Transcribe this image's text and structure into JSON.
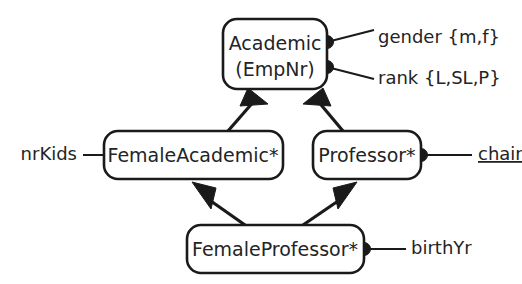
{
  "diagram": {
    "colors": {
      "stroke": "#1a1a1a",
      "text": "#242424",
      "background": "#ffffff"
    },
    "entities": [
      {
        "id": "academic",
        "line1": "Academic",
        "line2": "(EmpNr)"
      },
      {
        "id": "female_academic",
        "label": "FemaleAcademic*"
      },
      {
        "id": "professor",
        "label": "Professor*"
      },
      {
        "id": "female_professor",
        "label": "FemaleProfessor*"
      }
    ],
    "attributes": [
      {
        "id": "gender",
        "label": "gender {m,f}",
        "owner": "Academic",
        "underlined": false,
        "has_dot": true
      },
      {
        "id": "rank",
        "label": "rank {L,SL,P}",
        "owner": "Academic",
        "underlined": false,
        "has_dot": true
      },
      {
        "id": "nrkids",
        "label": "nrKids",
        "owner": "FemaleAcademic*",
        "underlined": false,
        "has_dot": false
      },
      {
        "id": "chair",
        "label": "chair",
        "owner": "Professor*",
        "underlined": true,
        "has_dot": true
      },
      {
        "id": "birthyr",
        "label": "birthYr",
        "owner": "FemaleProfessor*",
        "underlined": false,
        "has_dot": true
      }
    ],
    "subtype_links": [
      {
        "id": "fa-to-academic",
        "from": "FemaleAcademic*",
        "to": "Academic"
      },
      {
        "id": "prof-to-academic",
        "from": "Professor*",
        "to": "Academic"
      },
      {
        "id": "fp-to-fa",
        "from": "FemaleProfessor*",
        "to": "FemaleAcademic*"
      },
      {
        "id": "fp-to-prof",
        "from": "FemaleProfessor*",
        "to": "Professor*"
      }
    ]
  }
}
